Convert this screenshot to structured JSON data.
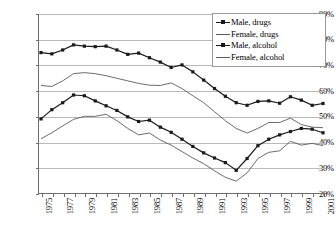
{
  "chart_data": {
    "type": "line",
    "title": "",
    "xlabel": "",
    "ylabel": "",
    "ylim": [
      20,
      90
    ],
    "ytick_values": [
      20,
      30,
      40,
      50,
      60,
      70,
      80,
      90
    ],
    "ytick_labels": [
      "20%",
      "30%",
      "40%",
      "50%",
      "60%",
      "70%",
      "80%",
      "90%"
    ],
    "grid": true,
    "legend_position": "top-right",
    "x": [
      1975,
      1976,
      1977,
      1978,
      1979,
      1980,
      1981,
      1982,
      1983,
      1984,
      1985,
      1986,
      1987,
      1988,
      1989,
      1990,
      1991,
      1992,
      1993,
      1994,
      1995,
      1996,
      1997,
      1998,
      1999,
      2000,
      2001
    ],
    "xtick_labels": [
      "1975",
      "",
      "1977",
      "",
      "1979",
      "",
      "1981",
      "",
      "1983",
      "",
      "1985",
      "",
      "1987",
      "",
      "1989",
      "",
      "1991",
      "",
      "1993",
      "",
      "1995",
      "",
      "1997",
      "",
      "1999",
      "",
      "2001"
    ],
    "xlabels_shown": [
      "1975",
      "1977",
      "1979",
      "1981",
      "1983",
      "1985",
      "1987",
      "1989",
      "1991",
      "1993",
      "1995",
      "1997",
      "1999",
      "2001"
    ],
    "series": [
      {
        "name": "Male, drugs",
        "marker": "square",
        "color": "#1a1a1a",
        "values": [
          75.0,
          74.5,
          76.0,
          78.0,
          77.5,
          77.3,
          77.5,
          76.0,
          74.3,
          74.8,
          73.0,
          71.3,
          69.2,
          70.2,
          67.5,
          64.3,
          61.0,
          58.0,
          55.5,
          54.5,
          56.0,
          56.2,
          55.3,
          57.8,
          56.5,
          54.5,
          55.2
        ]
      },
      {
        "name": "Female, drugs",
        "marker": "none",
        "color": "#5a5a5a",
        "values": [
          62.2,
          61.8,
          64.0,
          66.8,
          67.2,
          66.8,
          66.0,
          65.0,
          64.0,
          63.0,
          62.3,
          62.2,
          63.2,
          61.0,
          58.2,
          55.5,
          52.0,
          48.5,
          45.5,
          43.7,
          45.5,
          47.8,
          47.8,
          49.5,
          47.0,
          46.0,
          45.8
        ]
      },
      {
        "name": "Male, alcohol",
        "marker": "square",
        "color": "#1a1a1a",
        "values": [
          49.2,
          52.8,
          55.5,
          58.5,
          58.2,
          56.2,
          54.3,
          52.5,
          50.0,
          48.2,
          48.7,
          46.0,
          44.0,
          41.3,
          38.5,
          36.0,
          34.0,
          32.2,
          29.2,
          33.8,
          38.8,
          41.3,
          43.0,
          44.3,
          45.5,
          45.2,
          43.8
        ]
      },
      {
        "name": "Female, alcohol",
        "marker": "none",
        "color": "#5a5a5a",
        "values": [
          41.5,
          43.8,
          46.5,
          49.0,
          50.2,
          50.2,
          51.0,
          48.5,
          45.5,
          43.0,
          43.7,
          41.0,
          39.0,
          36.5,
          34.0,
          31.8,
          29.0,
          26.5,
          25.0,
          28.2,
          33.8,
          36.2,
          36.8,
          40.5,
          39.0,
          39.7,
          38.8
        ]
      }
    ]
  },
  "legend": {
    "entries": [
      {
        "label": "Male, drugs"
      },
      {
        "label": "Female, drugs"
      },
      {
        "label": "Male, alcohol"
      },
      {
        "label": "Female, alcohol"
      }
    ]
  }
}
